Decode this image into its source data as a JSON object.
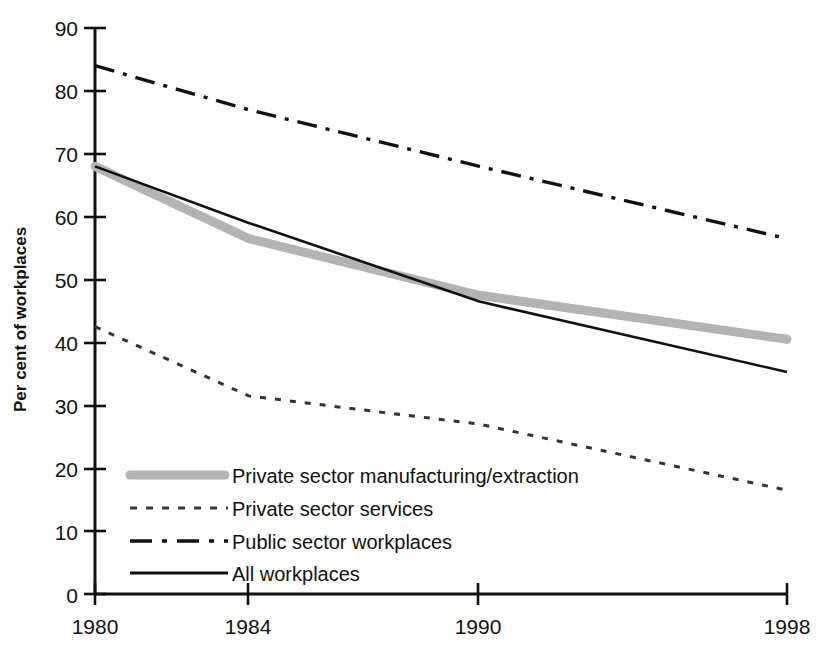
{
  "chart_data": {
    "type": "line",
    "title": "",
    "xlabel": "",
    "ylabel": "Per cent of workplaces",
    "x": [
      1980,
      1984,
      1990,
      1998
    ],
    "xtick_labels": [
      "1980",
      "1984",
      "1990",
      "1998"
    ],
    "ytick_labels": [
      "0",
      "10",
      "20",
      "30",
      "40",
      "50",
      "60",
      "70",
      "80",
      "90"
    ],
    "yticks": [
      0,
      10,
      20,
      30,
      40,
      50,
      60,
      70,
      80,
      90
    ],
    "ylim": [
      0,
      90
    ],
    "xlim": [
      1980,
      1998
    ],
    "grid": false,
    "legend_position": "inside-lower-left",
    "series": [
      {
        "name": "Private sector manufacturing/extraction",
        "style": "thick-grey-solid",
        "color": "#b3b3b3",
        "values": [
          68,
          56.5,
          47.5,
          40.5
        ]
      },
      {
        "name": "Private sector services",
        "style": "fine-dotted",
        "color": "#333333",
        "values": [
          42.5,
          31.5,
          27,
          16.5
        ]
      },
      {
        "name": "Public sector workplaces",
        "style": "dash-dot",
        "color": "#111111",
        "values": [
          84,
          77,
          68,
          56.5
        ]
      },
      {
        "name": "All workplaces",
        "style": "thin-solid",
        "color": "#111111",
        "values": [
          68,
          59,
          46.5,
          35.3
        ]
      }
    ]
  },
  "legend": {
    "items": [
      {
        "label": "Private sector manufacturing/extraction",
        "swatch": "thick-grey-solid"
      },
      {
        "label": "Private sector services",
        "swatch": "fine-dotted"
      },
      {
        "label": "Public sector workplaces",
        "swatch": "dash-dot"
      },
      {
        "label": "All workplaces",
        "swatch": "thin-solid"
      }
    ]
  }
}
